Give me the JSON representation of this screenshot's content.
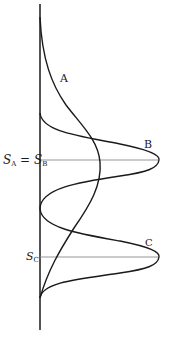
{
  "diagram": {
    "type": "distribution-curves",
    "curves": [
      {
        "id": "A",
        "label": "A",
        "description": "broad distribution, peak at S_A"
      },
      {
        "id": "B",
        "label": "B",
        "description": "narrow distribution, peak at S_B"
      },
      {
        "id": "C",
        "label": "C",
        "description": "narrow distribution, peak at S_C"
      }
    ],
    "levels": [
      {
        "id": "sab",
        "label_main": "S",
        "label_sub_1": "A",
        "label_eq": " = ",
        "label_main_2": "S",
        "label_sub_2": "B"
      },
      {
        "id": "sc",
        "label_main": "S",
        "label_sub": "C"
      }
    ]
  }
}
